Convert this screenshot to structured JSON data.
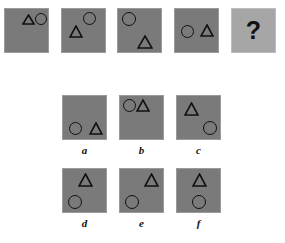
{
  "puzzle": {
    "type": "visual-analogy-matrix",
    "colors": {
      "cell_fill": "#7a7a7a",
      "cell_border": "#9a9a9a",
      "answer_cell_fill": "#a6a6a6",
      "shape_stroke": "#111111",
      "background": "#ffffff"
    },
    "question_mark": "?",
    "sequence": {
      "name": "stimulus-row",
      "cells": [
        {
          "id": "stim-1",
          "x": 4,
          "y": 8,
          "w": 45,
          "h": 45,
          "shapes": [
            {
              "kind": "triangle",
              "x": 17,
              "y": 5,
              "w": 13,
              "h": 11
            },
            {
              "kind": "circle",
              "x": 30,
              "y": 4,
              "w": 12,
              "h": 12
            }
          ]
        },
        {
          "id": "stim-2",
          "x": 61,
          "y": 8,
          "w": 45,
          "h": 45,
          "shapes": [
            {
              "kind": "circle",
              "x": 21,
              "y": 3,
              "w": 13,
              "h": 13
            },
            {
              "kind": "triangle",
              "x": 7,
              "y": 16,
              "w": 14,
              "h": 13
            }
          ]
        },
        {
          "id": "stim-3",
          "x": 117,
          "y": 8,
          "w": 45,
          "h": 45,
          "shapes": [
            {
              "kind": "circle",
              "x": 4,
              "y": 3,
              "w": 14,
              "h": 14
            },
            {
              "kind": "triangle",
              "x": 19,
              "y": 26,
              "w": 16,
              "h": 14
            }
          ]
        },
        {
          "id": "stim-4",
          "x": 174,
          "y": 8,
          "w": 45,
          "h": 45,
          "shapes": [
            {
              "kind": "circle",
              "x": 6,
              "y": 16,
              "w": 13,
              "h": 13
            },
            {
              "kind": "triangle",
              "x": 25,
              "y": 15,
              "w": 14,
              "h": 13
            }
          ]
        },
        {
          "id": "answer-slot",
          "x": 231,
          "y": 8,
          "w": 45,
          "h": 45,
          "light": true,
          "shapes": []
        }
      ]
    },
    "options": [
      {
        "id": "option-a",
        "label": "a",
        "x": 62,
        "y": 95,
        "w": 45,
        "h": 45,
        "label_x": 62,
        "label_y": 145,
        "label_w": 45,
        "shapes": [
          {
            "kind": "circle",
            "x": 6,
            "y": 26,
            "w": 13,
            "h": 13
          },
          {
            "kind": "triangle",
            "x": 26,
            "y": 26,
            "w": 14,
            "h": 13
          }
        ]
      },
      {
        "id": "option-b",
        "label": "b",
        "x": 119,
        "y": 95,
        "w": 45,
        "h": 45,
        "label_x": 119,
        "label_y": 145,
        "label_w": 45,
        "shapes": [
          {
            "kind": "circle",
            "x": 3,
            "y": 3,
            "w": 13,
            "h": 13
          },
          {
            "kind": "triangle",
            "x": 16,
            "y": 3,
            "w": 14,
            "h": 13
          }
        ]
      },
      {
        "id": "option-c",
        "label": "c",
        "x": 176,
        "y": 95,
        "w": 45,
        "h": 45,
        "label_x": 176,
        "label_y": 145,
        "label_w": 45,
        "shapes": [
          {
            "kind": "triangle",
            "x": 7,
            "y": 6,
            "w": 15,
            "h": 14
          },
          {
            "kind": "circle",
            "x": 26,
            "y": 25,
            "w": 14,
            "h": 14
          }
        ]
      },
      {
        "id": "option-d",
        "label": "d",
        "x": 62,
        "y": 168,
        "w": 45,
        "h": 45,
        "label_x": 62,
        "label_y": 218,
        "label_w": 45,
        "shapes": [
          {
            "kind": "triangle",
            "x": 15,
            "y": 4,
            "w": 15,
            "h": 14
          },
          {
            "kind": "circle",
            "x": 5,
            "y": 26,
            "w": 14,
            "h": 14
          }
        ]
      },
      {
        "id": "option-e",
        "label": "e",
        "x": 119,
        "y": 168,
        "w": 45,
        "h": 45,
        "label_x": 119,
        "label_y": 218,
        "label_w": 45,
        "shapes": [
          {
            "kind": "triangle",
            "x": 24,
            "y": 4,
            "w": 15,
            "h": 14
          },
          {
            "kind": "circle",
            "x": 5,
            "y": 26,
            "w": 14,
            "h": 14
          }
        ]
      },
      {
        "id": "option-f",
        "label": "f",
        "x": 176,
        "y": 168,
        "w": 45,
        "h": 45,
        "label_x": 176,
        "label_y": 218,
        "label_w": 45,
        "shapes": [
          {
            "kind": "triangle",
            "x": 15,
            "y": 4,
            "w": 15,
            "h": 14
          },
          {
            "kind": "circle",
            "x": 15,
            "y": 26,
            "w": 14,
            "h": 14
          }
        ]
      }
    ]
  }
}
